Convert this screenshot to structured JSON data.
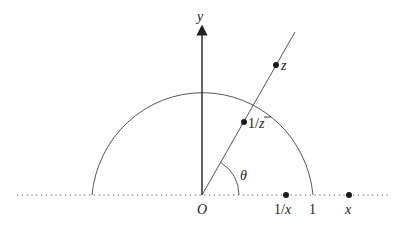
{
  "diagram": {
    "colors": {
      "line": "#333333",
      "dot": "#1a1a1a",
      "background": "#ffffff"
    },
    "labels": {
      "y_axis": "y",
      "origin": "O",
      "angle": "θ",
      "point_z": "z",
      "point_inv_conj": "1/z̄",
      "point_inv_conj_num": "1/",
      "point_inv_conj_den": "z",
      "point_inv_x_num": "1/",
      "point_inv_x_den": "x",
      "one": "1",
      "point_x": "x"
    },
    "geometry": {
      "origin": [
        202,
        195
      ],
      "unit_radius": 111,
      "ray_end": [
        295,
        32
      ],
      "z": [
        276,
        65
      ],
      "inv_conj_z": [
        244,
        122
      ],
      "inv_x": [
        286,
        195
      ],
      "x": [
        349,
        195
      ],
      "real_axis_range": [
        17,
        388
      ],
      "y_axis_top": 26,
      "angle_arc_radius": 37
    }
  }
}
